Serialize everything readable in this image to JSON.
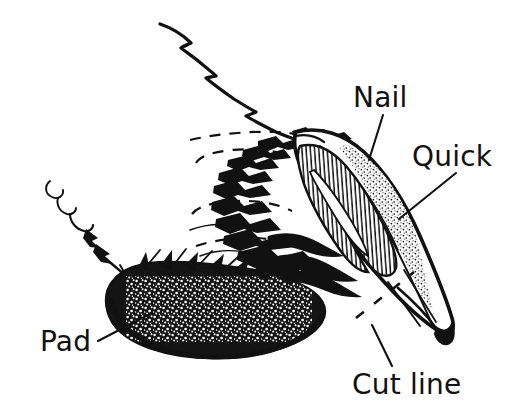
{
  "figure": {
    "background_color": "#ffffff",
    "ink_color": "#111111",
    "width": 515,
    "height": 417
  },
  "labels": [
    {
      "id": "nail",
      "text": "Nail",
      "x": 353,
      "y": 107,
      "anchor": "start",
      "leader": {
        "x1": 383,
        "y1": 115,
        "x2": 369,
        "y2": 160
      }
    },
    {
      "id": "quick",
      "text": "Quick",
      "x": 412,
      "y": 166,
      "anchor": "start",
      "leader": {
        "x1": 456,
        "y1": 173,
        "x2": 399,
        "y2": 219
      }
    },
    {
      "id": "pad",
      "text": "Pad",
      "x": 40,
      "y": 351,
      "anchor": "start",
      "leader": {
        "x1": 98,
        "y1": 341,
        "x2": 152,
        "y2": 313
      }
    },
    {
      "id": "cut-line",
      "text": "Cut line",
      "x": 352,
      "y": 394,
      "anchor": "start",
      "leader": {
        "x1": 392,
        "y1": 366,
        "x2": 372,
        "y2": 325
      }
    }
  ],
  "parts": [
    {
      "id": "nail",
      "name": "Nail",
      "note": "Curved horn-shaped claw on the right, outlined in heavy ink with a stippled outer edge"
    },
    {
      "id": "quick",
      "name": "Quick",
      "note": "Hook shaped region inside the claw filled with fine vertical hatching"
    },
    {
      "id": "pad",
      "name": "Pad",
      "note": "Dark stippled oval footpad at lower left"
    },
    {
      "id": "cut-line",
      "name": "Cut line",
      "note": "Short dashed line crossing the claw in front of the quick marking where to trim"
    },
    {
      "id": "fur",
      "name": "Fur",
      "note": "Ragged spiky outlines above and around the paw"
    },
    {
      "id": "hidden-outline",
      "name": "Hidden outline",
      "note": "Three long horizontal dashed lines indicating hidden toe contours"
    }
  ]
}
